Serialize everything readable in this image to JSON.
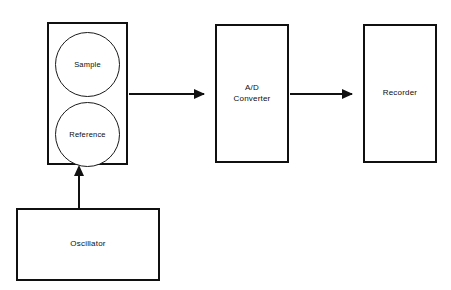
{
  "diagram": {
    "type": "block-diagram",
    "background_color": "#ffffff",
    "line_color": "#111111",
    "blocks": [
      {
        "id": "detector",
        "label": "",
        "cells": [
          {
            "id": "sample",
            "label": "Sample"
          },
          {
            "id": "reference",
            "label": "Reference"
          }
        ]
      },
      {
        "id": "ad_converter",
        "label": "A/D\nConverter"
      },
      {
        "id": "recorder",
        "label": "Recorder"
      },
      {
        "id": "oscillator",
        "label": "Oscillator"
      }
    ],
    "connections": [
      {
        "id": "detector-to-ad",
        "from": "detector",
        "to": "ad_converter",
        "direction": "right"
      },
      {
        "id": "ad-to-recorder",
        "from": "ad_converter",
        "to": "recorder",
        "direction": "right"
      },
      {
        "id": "oscillator-to-detector",
        "from": "oscillator",
        "to": "detector",
        "direction": "up"
      }
    ]
  },
  "labels": {
    "sample": "Sample",
    "reference": "Reference",
    "ad_converter": "A/D\nConverter",
    "recorder": "Recorder",
    "oscillator": "Oscillator",
    "caption_artifact": ""
  }
}
